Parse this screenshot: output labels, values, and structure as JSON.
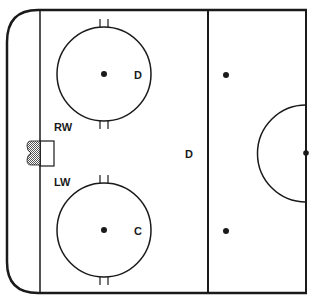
{
  "diagram": {
    "colors": {
      "line": "#1a1a1a",
      "background": "#ffffff",
      "net_fill": "#9a9a9a"
    },
    "labels": {
      "top_circle_player": "D",
      "bottom_circle_player": "C",
      "right_wing": "RW",
      "left_wing": "LW",
      "point_defense": "D"
    }
  }
}
